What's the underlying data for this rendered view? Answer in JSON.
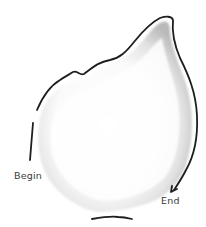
{
  "diagram": {
    "type": "sketched leaf outline with tracing path",
    "labels": {
      "begin": "Begin",
      "end": "End"
    },
    "colors": {
      "stroke": "#1e1e1e",
      "shade_dark": "#b8b8b8",
      "shade_light": "#ececec",
      "background": "#ffffff",
      "label": "#3a3a3a"
    },
    "elements": [
      {
        "name": "leaf-shape",
        "description": "grey shaded leaf / teardrop shape"
      },
      {
        "name": "outline-path",
        "description": "hand-drawn line tracing the top edge from left to the pointed tip then down the right side"
      },
      {
        "name": "arrow-head",
        "description": "arrowhead at lower right showing path direction toward End"
      },
      {
        "name": "begin-tick",
        "description": "short vertical stroke on left edge marking start"
      },
      {
        "name": "bottom-tick",
        "description": "short horizontal stroke under the base"
      }
    ]
  }
}
